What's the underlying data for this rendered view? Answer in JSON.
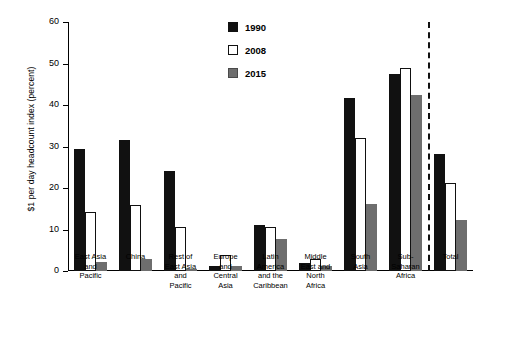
{
  "chart_data": {
    "type": "bar",
    "title": "",
    "xlabel": "",
    "ylabel": "$1 per day headcount index (percent)",
    "ylim": [
      0,
      60
    ],
    "yticks": [
      0,
      10,
      20,
      30,
      40,
      50,
      60
    ],
    "ytick_labels": [
      "0",
      "10",
      "20",
      "30",
      "40",
      "50",
      "60"
    ],
    "grid": false,
    "legend_position": "top-center",
    "categories": [
      "East Asia\nand\nPacific",
      "China",
      "Rest of\nEast Asia\nand\nPacific",
      "Europe\nand\nCentral\nAsia",
      "Latin\nAmerica\nand the\nCaribbean",
      "Middle\nEast and\nNorth\nAfrica",
      "South\nAsia",
      "Sub-\nSaharan\nAfrica",
      "Total"
    ],
    "series": [
      {
        "name": "1990",
        "color": "#111111",
        "values": [
          29.3,
          31.5,
          24.0,
          1.3,
          11.0,
          2.0,
          41.6,
          47.5,
          28.1
        ]
      },
      {
        "name": "2008",
        "color": "#ffffff",
        "values": [
          14.2,
          15.8,
          10.5,
          3.9,
          10.7,
          2.8,
          32.0,
          49.0,
          21.3
        ]
      },
      {
        "name": "2015",
        "color": "#6e6e6e",
        "values": [
          2.2,
          2.9,
          0.6,
          1.1,
          7.6,
          1.2,
          16.2,
          42.3,
          12.2
        ]
      }
    ],
    "annotations": [
      {
        "type": "vertical-dashed-line",
        "after_category": "Sub-\nSaharan\nAfrica",
        "label": ""
      }
    ]
  },
  "legend": {
    "entries": [
      {
        "label": "1990",
        "swatch": "filled-black-square"
      },
      {
        "label": "2008",
        "swatch": "open-white-square"
      },
      {
        "label": "2015",
        "swatch": "filled-gray-square"
      }
    ]
  },
  "colors": {
    "series_1990": "#111111",
    "series_2008": "#ffffff",
    "series_2015": "#6e6e6e",
    "axis": "#000000",
    "background": "#ffffff"
  }
}
